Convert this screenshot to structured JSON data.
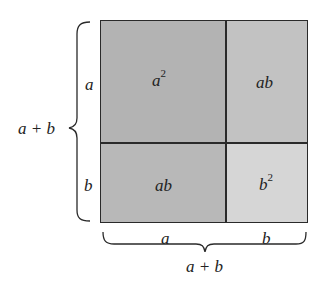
{
  "diagram": {
    "cells": {
      "top_left": {
        "label": "a",
        "exp": "2",
        "fill": "#b3b3b3"
      },
      "top_right": {
        "label": "ab",
        "fill": "#c2c2c2"
      },
      "bottom_left": {
        "label": "ab",
        "fill": "#b8b8b8"
      },
      "bottom_right": {
        "label": "b",
        "exp": "2",
        "fill": "#d6d6d6"
      }
    },
    "left_side": {
      "a_label": "a",
      "b_label": "b",
      "total_label": "a + b"
    },
    "bottom_side": {
      "a_label": "a",
      "b_label": "b",
      "total_label": "a + b"
    },
    "colors": {
      "line": "#2a2a2a",
      "text": "#222222"
    }
  }
}
